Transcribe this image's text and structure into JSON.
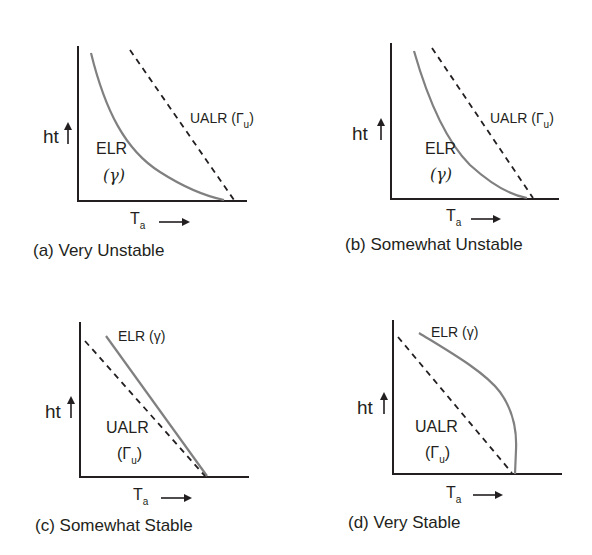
{
  "figure": {
    "y_axis_label": "ht",
    "x_axis_label_main": "T",
    "x_axis_label_sub": "a",
    "colors": {
      "elr": "#808080",
      "ualr": "#231f20",
      "axis": "#231f20"
    }
  },
  "panels": [
    {
      "id": "a",
      "caption": "(a) Very Unstable",
      "elr_label": "ELR",
      "elr_symbol": "(γ)",
      "ualr_label": "UALR (Γ",
      "ualr_sub": "u",
      "ualr_close": ")",
      "elr_shape": "concave curve, lower-left of UALR"
    },
    {
      "id": "b",
      "caption": "(b) Somewhat Unstable",
      "elr_label": "ELR",
      "elr_symbol": "(γ)",
      "ualr_label": "UALR (Γ",
      "ualr_sub": "u",
      "ualr_close": ")",
      "elr_shape": "slightly curved, just left of UALR"
    },
    {
      "id": "c",
      "caption": "(c) Somewhat Stable",
      "elr_label": "ELR (γ)",
      "ualr_label": "UALR",
      "ualr_open": "(Γ",
      "ualr_sub": "u",
      "ualr_close": ")",
      "elr_shape": "straight line, right of UALR"
    },
    {
      "id": "d",
      "caption": "(d) Very Stable",
      "elr_label": "ELR (γ)",
      "ualr_label": "UALR",
      "ualr_open": "(Γ",
      "ualr_sub": "u",
      "ualr_close": ")",
      "elr_shape": "convex curve bending to vertical, right of UALR"
    }
  ]
}
